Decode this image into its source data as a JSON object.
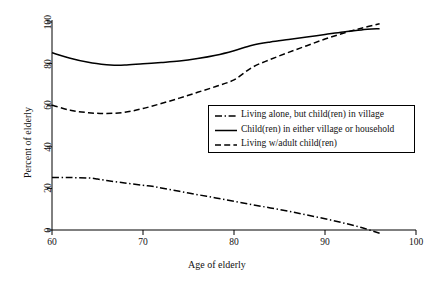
{
  "chart_data": {
    "type": "line",
    "title": "",
    "xlabel": "Age of elderly",
    "ylabel": "Percent of elderly",
    "xlim": [
      60,
      100
    ],
    "ylim": [
      0,
      100
    ],
    "xticks": [
      60,
      70,
      80,
      90,
      100
    ],
    "yticks": [
      0,
      20,
      40,
      60,
      80,
      100
    ],
    "xtick_labels": [
      "60",
      "70",
      "80",
      "90",
      "100"
    ],
    "ytick_labels": [
      "0",
      "20",
      "40",
      "60",
      "80",
      "100"
    ],
    "grid": false,
    "legend_position": "center-right",
    "line_color": "#000000",
    "background_color": "#ffffff",
    "series": [
      {
        "name": "Living alone, but child(ren) in village",
        "style": "dash-dot",
        "x": [
          60,
          62,
          64,
          65,
          66,
          68,
          70,
          71,
          72,
          74,
          76,
          78,
          80,
          82,
          84,
          86,
          88,
          90,
          92,
          94,
          96
        ],
        "values": [
          25.2,
          25.2,
          25.0,
          24.5,
          23.8,
          22.6,
          21.5,
          21.0,
          20.2,
          18.6,
          17.0,
          15.4,
          13.8,
          12.2,
          10.6,
          9.0,
          7.2,
          5.4,
          3.4,
          1.2,
          -1.6
        ]
      },
      {
        "name": "Child(ren) in either village or household",
        "style": "solid",
        "x": [
          60,
          62,
          64,
          66,
          67,
          68,
          70,
          72,
          74,
          76,
          78,
          80,
          82,
          84,
          86,
          88,
          90,
          92,
          94,
          96
        ],
        "values": [
          85.2,
          82.6,
          80.6,
          79.4,
          79.2,
          79.3,
          79.9,
          80.5,
          81.2,
          82.4,
          84.0,
          86.2,
          88.8,
          90.4,
          91.6,
          92.8,
          94.0,
          95.2,
          96.2,
          96.8
        ]
      },
      {
        "name": "Living w/adult child(ren)",
        "style": "dashed",
        "x": [
          60,
          62,
          64,
          66,
          68,
          70,
          72,
          74,
          76,
          78,
          80,
          82,
          84,
          86,
          88,
          90,
          92,
          94,
          96
        ],
        "values": [
          60.0,
          57.6,
          56.4,
          56.0,
          56.6,
          58.4,
          60.8,
          63.4,
          66.2,
          69.0,
          72.2,
          78.2,
          82.0,
          85.4,
          88.6,
          91.8,
          94.6,
          97.0,
          99.2
        ]
      }
    ]
  },
  "legend": {
    "items": [
      {
        "label": "Living alone, but child(ren) in village",
        "style": "dash-dot"
      },
      {
        "label": "Child(ren) in either village or household",
        "style": "solid"
      },
      {
        "label": "Living w/adult child(ren)",
        "style": "dashed"
      }
    ]
  }
}
